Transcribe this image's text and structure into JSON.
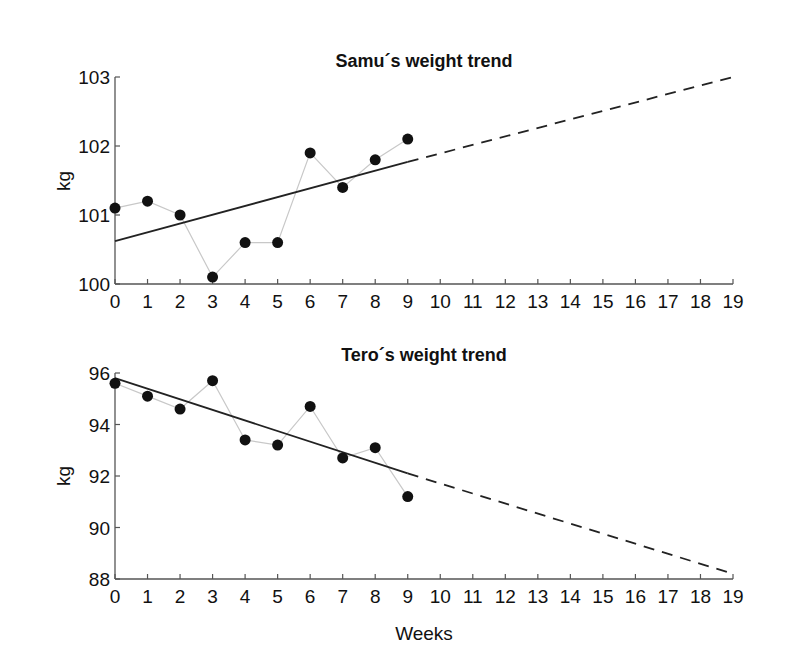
{
  "chart_data": [
    {
      "type": "line",
      "title": "Samu´s weight trend",
      "xlabel": "",
      "ylabel": "kg",
      "x": [
        0,
        1,
        2,
        3,
        4,
        5,
        6,
        7,
        8,
        9
      ],
      "series": [
        {
          "name": "Measured weight",
          "style": "markers+thin-gray-line",
          "values": [
            101.1,
            101.2,
            101.0,
            100.1,
            100.6,
            100.6,
            101.9,
            101.4,
            101.8,
            102.1
          ]
        },
        {
          "name": "Linear trend (fit)",
          "style": "solid",
          "x": [
            0,
            9
          ],
          "values": [
            100.62,
            101.77
          ]
        },
        {
          "name": "Trend projection",
          "style": "dashed",
          "x": [
            9,
            19
          ],
          "values": [
            101.77,
            103.0
          ]
        }
      ],
      "xlim": [
        0,
        19
      ],
      "ylim": [
        100,
        103
      ],
      "xticks": [
        0,
        1,
        2,
        3,
        4,
        5,
        6,
        7,
        8,
        9,
        10,
        11,
        12,
        13,
        14,
        15,
        16,
        17,
        18,
        19
      ],
      "yticks": [
        100,
        101,
        102,
        103
      ],
      "grid": false
    },
    {
      "type": "line",
      "title": "Tero´s weight trend",
      "xlabel": "Weeks",
      "ylabel": "kg",
      "x": [
        0,
        1,
        2,
        3,
        4,
        5,
        6,
        7,
        8,
        9
      ],
      "series": [
        {
          "name": "Measured weight",
          "style": "markers+thin-gray-line",
          "values": [
            95.6,
            95.1,
            94.6,
            95.7,
            93.4,
            93.2,
            94.7,
            92.7,
            93.1,
            91.2
          ]
        },
        {
          "name": "Linear trend (fit)",
          "style": "solid",
          "x": [
            0,
            9
          ],
          "values": [
            95.8,
            92.1
          ]
        },
        {
          "name": "Trend projection",
          "style": "dashed",
          "x": [
            9,
            19
          ],
          "values": [
            92.1,
            88.2
          ]
        }
      ],
      "xlim": [
        0,
        19
      ],
      "ylim": [
        88,
        96
      ],
      "xticks": [
        0,
        1,
        2,
        3,
        4,
        5,
        6,
        7,
        8,
        9,
        10,
        11,
        12,
        13,
        14,
        15,
        16,
        17,
        18,
        19
      ],
      "yticks": [
        88,
        90,
        92,
        94,
        96
      ],
      "grid": false
    }
  ],
  "charts": {
    "top": {
      "title": "Samu´s weight trend",
      "ylabel": "kg"
    },
    "bottom": {
      "title": "Tero´s weight trend",
      "ylabel": "kg",
      "xlabel": "Weeks"
    }
  },
  "colors": {
    "axis": "#555555",
    "marker": "#111111",
    "connector": "#c8c8c8",
    "trend": "#222222"
  }
}
